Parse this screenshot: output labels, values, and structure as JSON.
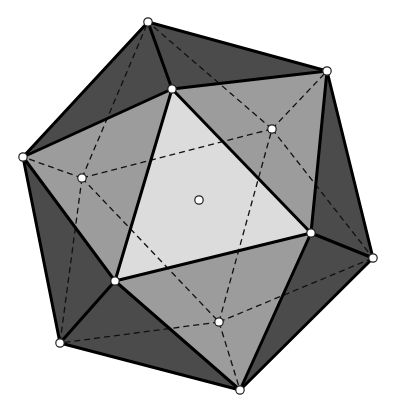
{
  "diagram": {
    "colors": {
      "background": "#ffffff",
      "face_light": "#dcdcdc",
      "face_medium": "#9c9c9c",
      "face_dark": "#4b4b4b",
      "edge": "#000000",
      "vertex_fill": "#ffffff"
    },
    "vertices": {
      "A": [
        148,
        22
      ],
      "B": [
        327,
        71
      ],
      "C": [
        23,
        157
      ],
      "D": [
        172,
        89
      ],
      "E": [
        311,
        233
      ],
      "F": [
        115,
        281
      ],
      "G": [
        373,
        258
      ],
      "H": [
        60,
        343
      ],
      "I": [
        240,
        390
      ],
      "J": [
        272,
        129
      ],
      "K": [
        82,
        178
      ],
      "L": [
        219,
        322
      ]
    },
    "center_point": [
      199,
      200
    ],
    "faces": [
      {
        "v": [
          "D",
          "E",
          "F"
        ],
        "shade": "face_light"
      },
      {
        "v": [
          "C",
          "D",
          "F"
        ],
        "shade": "face_medium"
      },
      {
        "v": [
          "B",
          "D",
          "E"
        ],
        "shade": "face_medium"
      },
      {
        "v": [
          "E",
          "F",
          "I"
        ],
        "shade": "face_medium"
      },
      {
        "v": [
          "A",
          "B",
          "D"
        ],
        "shade": "face_dark"
      },
      {
        "v": [
          "A",
          "C",
          "D"
        ],
        "shade": "face_dark"
      },
      {
        "v": [
          "B",
          "G",
          "E"
        ],
        "shade": "face_dark"
      },
      {
        "v": [
          "G",
          "I",
          "E"
        ],
        "shade": "face_dark"
      },
      {
        "v": [
          "I",
          "H",
          "F"
        ],
        "shade": "face_dark"
      },
      {
        "v": [
          "H",
          "C",
          "F"
        ],
        "shade": "face_dark"
      }
    ],
    "solid_edges": [
      [
        "A",
        "B"
      ],
      [
        "B",
        "G"
      ],
      [
        "G",
        "I"
      ],
      [
        "I",
        "H"
      ],
      [
        "H",
        "C"
      ],
      [
        "C",
        "A"
      ],
      [
        "D",
        "E"
      ],
      [
        "E",
        "F"
      ],
      [
        "F",
        "D"
      ],
      [
        "A",
        "D"
      ],
      [
        "B",
        "D"
      ],
      [
        "B",
        "E"
      ],
      [
        "G",
        "E"
      ],
      [
        "I",
        "E"
      ],
      [
        "I",
        "F"
      ],
      [
        "H",
        "F"
      ],
      [
        "C",
        "F"
      ],
      [
        "C",
        "D"
      ]
    ],
    "hidden_edges": [
      [
        "J",
        "K"
      ],
      [
        "K",
        "L"
      ],
      [
        "L",
        "J"
      ],
      [
        "J",
        "A"
      ],
      [
        "J",
        "B"
      ],
      [
        "J",
        "G"
      ],
      [
        "K",
        "A"
      ],
      [
        "K",
        "C"
      ],
      [
        "K",
        "H"
      ],
      [
        "L",
        "H"
      ],
      [
        "L",
        "I"
      ],
      [
        "L",
        "G"
      ]
    ]
  }
}
